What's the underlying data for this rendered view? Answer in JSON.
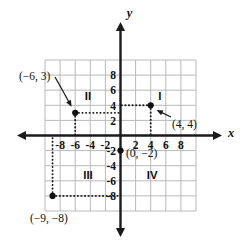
{
  "chart_data": {
    "type": "scatter",
    "title": "",
    "xlabel": "x",
    "ylabel": "y",
    "xlim": [
      -10,
      10
    ],
    "ylim": [
      -10,
      10
    ],
    "grid": true,
    "legend": "none",
    "x_ticks": [
      "-8",
      "-6",
      "-4",
      "-2",
      "2",
      "4",
      "6",
      "8"
    ],
    "x_tick_values": [
      -8,
      -6,
      -4,
      -2,
      2,
      4,
      6,
      8
    ],
    "y_ticks": [
      "8",
      "6",
      "4",
      "2",
      "-2",
      "-4",
      "-6",
      "-8"
    ],
    "y_tick_values": [
      8,
      6,
      4,
      2,
      -2,
      -4,
      -6,
      -8
    ],
    "points": [
      {
        "name": "point-neg6-3",
        "label": "(−6, 3)",
        "x": -6,
        "y": 3
      },
      {
        "name": "point-4-4",
        "label": "(4, 4)",
        "x": 4,
        "y": 4
      },
      {
        "name": "point-0-neg2",
        "label": "(0, −2)",
        "x": 0,
        "y": -2
      },
      {
        "name": "point-neg9-neg8",
        "label": "(−9, −8)",
        "x": -9,
        "y": -8
      }
    ],
    "quadrants": [
      {
        "name": "quadrant-1",
        "label": "I",
        "x": 5.2,
        "y": 5.2
      },
      {
        "name": "quadrant-2",
        "label": "II",
        "x": -4.3,
        "y": 5.2
      },
      {
        "name": "quadrant-3",
        "label": "III",
        "x": -4.3,
        "y": -5.2
      },
      {
        "name": "quadrant-4",
        "label": "IV",
        "x": 4.2,
        "y": -5.2
      }
    ],
    "colors": {
      "grid": "#b9b9bb",
      "axis": "#1a1a1a",
      "point": "#111111",
      "background": "#ffffff"
    }
  },
  "axes": {
    "x_name": "x",
    "y_name": "y"
  }
}
